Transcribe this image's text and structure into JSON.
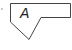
{
  "callout": {
    "label": "A",
    "stroke_color": "#444444",
    "fill_color": "#ffffff"
  }
}
